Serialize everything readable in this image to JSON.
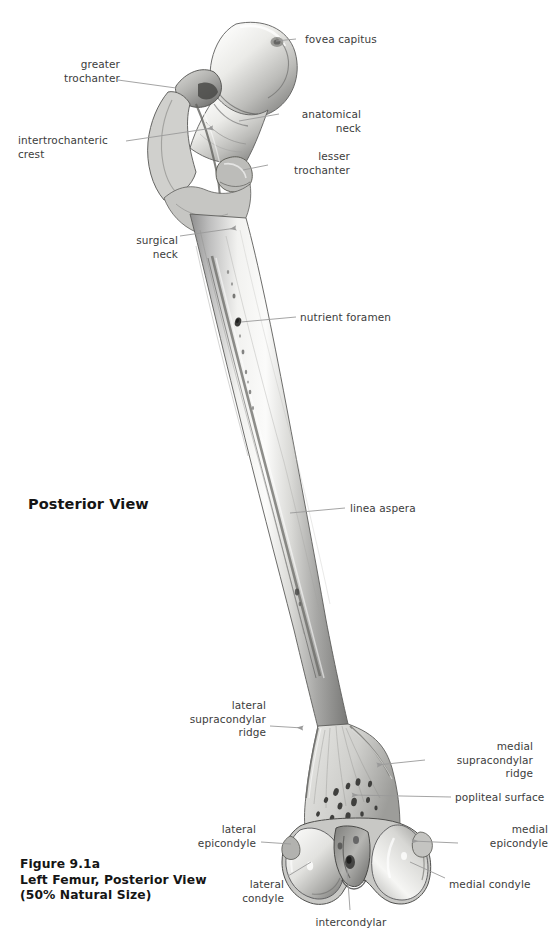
{
  "figure": {
    "view_heading": "Posterior View",
    "caption": "Figure 9.1a\nLeft Femur, Posterior View\n(50% Natural Size)",
    "caption_number": "Figure 9.1a",
    "caption_title": "Left Femur, Posterior View",
    "caption_scale": "(50% Natural Size)",
    "background_color": "#ffffff",
    "label_color": "#3c3c3c",
    "leader_color": "#9a9a9a",
    "caption_color": "#151515"
  },
  "labels": [
    {
      "id": "fovea-capitus",
      "text": "fovea capitus",
      "align": "left",
      "x": 305,
      "y": 33,
      "w": 120
    },
    {
      "id": "greater-trochanter",
      "text": "greater\ntrochanter",
      "align": "right",
      "x": 28,
      "y": 58,
      "w": 92
    },
    {
      "id": "anatomical-neck",
      "text": "anatomical\nneck",
      "align": "right",
      "x": 283,
      "y": 108,
      "w": 78
    },
    {
      "id": "intertrochanteric-crest",
      "text": "intertrochanteric\ncrest",
      "align": "left",
      "x": 18,
      "y": 134,
      "w": 106
    },
    {
      "id": "lesser-trochanter",
      "text": "lesser\ntrochanter",
      "align": "right",
      "x": 272,
      "y": 150,
      "w": 78
    },
    {
      "id": "surgical-neck",
      "text": "surgical\nneck",
      "align": "right",
      "x": 122,
      "y": 234,
      "w": 56
    },
    {
      "id": "nutrient-foramen",
      "text": "nutrient foramen",
      "align": "left",
      "x": 300,
      "y": 311,
      "w": 120
    },
    {
      "id": "linea-aspera",
      "text": "linea aspera",
      "align": "left",
      "x": 350,
      "y": 502,
      "w": 92
    },
    {
      "id": "lateral-supracondylar-ridge",
      "text": "lateral\nsupracondylar\nridge",
      "align": "right",
      "x": 188,
      "y": 699,
      "w": 78
    },
    {
      "id": "medial-supracondylar-ridge",
      "text": "medial\nsupracondylar\nridge",
      "align": "right",
      "x": 429,
      "y": 740,
      "w": 104
    },
    {
      "id": "popliteal-surface",
      "text": "popliteal surface",
      "align": "left",
      "x": 455,
      "y": 791,
      "w": 98
    },
    {
      "id": "lateral-epicondyle",
      "text": "lateral\nepicondyle",
      "align": "right",
      "x": 184,
      "y": 823,
      "w": 72
    },
    {
      "id": "medial-epicondyle",
      "text": "medial\nepicondyle",
      "align": "right",
      "x": 462,
      "y": 823,
      "w": 86
    },
    {
      "id": "lateral-condyle",
      "text": "lateral\ncondyle",
      "align": "right",
      "x": 222,
      "y": 878,
      "w": 62
    },
    {
      "id": "medial-condyle",
      "text": "medial condyle",
      "align": "left",
      "x": 449,
      "y": 878,
      "w": 104
    },
    {
      "id": "intercondylar",
      "text": "intercondylar",
      "align": "center",
      "x": 296,
      "y": 916,
      "w": 110
    }
  ],
  "leaders": [
    {
      "id": "leader-fovea-capitus",
      "points": "296,39 276,41",
      "marker": "none"
    },
    {
      "id": "leader-greater-trochanter",
      "points": "118,80 176,88",
      "marker": "none"
    },
    {
      "id": "leader-anatomical-neck",
      "points": "279,114 239,121",
      "marker": "none"
    },
    {
      "id": "leader-intertrochanteric-crest",
      "points": "126,141 213,128",
      "marker": "arrow"
    },
    {
      "id": "leader-lesser-trochanter",
      "points": "268,165 243,170",
      "marker": "none"
    },
    {
      "id": "leader-surgical-neck",
      "points": "180,236 236,228",
      "marker": "arrow"
    },
    {
      "id": "leader-nutrient-foramen",
      "points": "296,317 241,322",
      "marker": "none"
    },
    {
      "id": "leader-linea-aspera",
      "points": "345,508 290,513",
      "marker": "none"
    },
    {
      "id": "leader-lateral-supracondylar",
      "points": "270,726 303,728",
      "marker": "arrow"
    },
    {
      "id": "leader-medial-supracondylar",
      "points": "425,760 377,765",
      "marker": "arrow"
    },
    {
      "id": "leader-popliteal-surface",
      "points": "451,797 352,795",
      "marker": "arrow"
    },
    {
      "id": "leader-lateral-epicondyle",
      "points": "261,842 291,844",
      "marker": "none"
    },
    {
      "id": "leader-medial-epicondyle",
      "points": "458,843 412,841",
      "marker": "arrow"
    },
    {
      "id": "leader-lateral-condyle",
      "points": "288,876 311,862",
      "marker": "none"
    },
    {
      "id": "leader-medial-condyle",
      "points": "445,878 410,862",
      "marker": "none"
    },
    {
      "id": "leader-intercondylar",
      "points": "350,910 347,868",
      "marker": "none"
    }
  ]
}
